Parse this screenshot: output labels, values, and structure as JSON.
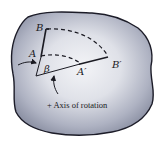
{
  "figure": {
    "labels": {
      "B": "B",
      "A": "A",
      "A_prime": "A′",
      "B_prime": "B′",
      "beta": "β"
    },
    "caption": "+ Axis of rotation",
    "colors": {
      "body_fill_center": "#f1f2f6",
      "body_fill_edge": "#8e93a6",
      "outline": "#1c1c28",
      "ink": "#1a1a22"
    }
  }
}
